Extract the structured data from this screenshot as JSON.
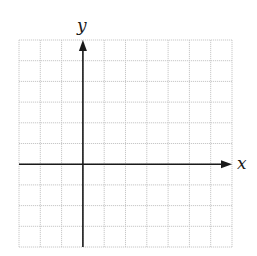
{
  "diagram": {
    "type": "coordinate-grid",
    "grid": {
      "columns": 10,
      "rows": 10,
      "left": 19,
      "top": 40,
      "right": 232,
      "bottom": 247,
      "line_color": "#c8c8c8",
      "line_style": "dotted"
    },
    "axes": {
      "origin_col": 3,
      "origin_row": 6,
      "color": "#1a1a1a",
      "x_label": "x",
      "y_label": "y",
      "x_arrow": "positive-end",
      "y_arrow": "positive-end"
    }
  },
  "chart_data": {
    "type": "scatter",
    "title": "",
    "xlabel": "x",
    "ylabel": "y",
    "xlim": [
      -3,
      7
    ],
    "ylim": [
      -4,
      6
    ],
    "grid": true,
    "series": [],
    "legend": null
  }
}
